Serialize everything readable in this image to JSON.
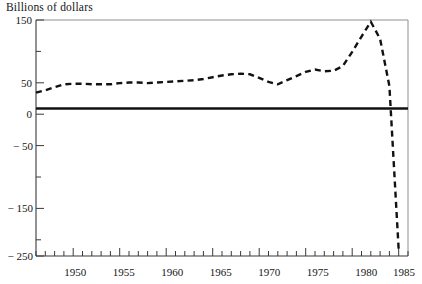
{
  "chart_data": {
    "type": "line",
    "title": "Billions of dollars",
    "subtitle": "",
    "xlabel": "",
    "ylabel": "",
    "xlim": [
      1946,
      1986
    ],
    "ylim": [
      -250,
      150
    ],
    "grid": false,
    "legend": "none",
    "line_style": "dashed",
    "line_color": "#121212",
    "zero_line": true,
    "zero_line_color": "#121212",
    "y_ticks_major": [
      150,
      50,
      0,
      -50,
      -150,
      -250
    ],
    "y_tick_labels": [
      "150",
      "50",
      "0",
      "− 50",
      "− 150",
      "− 250"
    ],
    "y_ticks_minor": [
      100,
      -100,
      -200
    ],
    "x_ticks_major": [
      1950,
      1955,
      1960,
      1965,
      1970,
      1975,
      1980,
      1985
    ],
    "x_tick_labels": [
      "1950",
      "1955",
      "1960",
      "1965",
      "1970",
      "1975",
      "1980",
      "1985"
    ],
    "x_tick_minor_step": 1,
    "x": [
      1946,
      1947,
      1948,
      1949,
      1950,
      1951,
      1952,
      1953,
      1954,
      1955,
      1956,
      1957,
      1958,
      1959,
      1960,
      1961,
      1962,
      1963,
      1964,
      1965,
      1966,
      1967,
      1968,
      1969,
      1970,
      1971,
      1972,
      1973,
      1974,
      1975,
      1976,
      1977,
      1978,
      1979,
      1980,
      1981,
      1982,
      1983,
      1984,
      1985
    ],
    "values": [
      27,
      31,
      36,
      41,
      42,
      42,
      41,
      41,
      41,
      43,
      44,
      44,
      43,
      44,
      45,
      46,
      47,
      48,
      50,
      53,
      56,
      58,
      59,
      58,
      52,
      45,
      41,
      48,
      55,
      62,
      66,
      63,
      64,
      72,
      96,
      122,
      147,
      118,
      38,
      -240
    ],
    "annotations": []
  },
  "axes": {
    "title_text": "Billions of dollars"
  }
}
